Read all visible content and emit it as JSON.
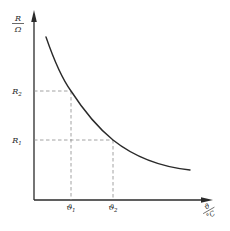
{
  "diagram": {
    "type": "resistance-temperature curve (NTC thermistor)",
    "y_axis": {
      "numerator": "R",
      "denominator": "Ω",
      "ticks": [
        {
          "label": "R",
          "subscript": "2",
          "y_px": 91
        },
        {
          "label": "R",
          "subscript": "1",
          "y_px": 140
        }
      ]
    },
    "x_axis": {
      "numerator": "ϑ",
      "denominator": "°C",
      "ticks": [
        {
          "label": "ϑ",
          "subscript": "1",
          "x_px": 71
        },
        {
          "label": "ϑ",
          "subscript": "2",
          "x_px": 113
        }
      ]
    },
    "curve": {
      "description": "monotonically decreasing convex curve",
      "start": [
        46,
        37
      ],
      "end": [
        190,
        170
      ]
    },
    "colors": {
      "line": "#2a2a2a",
      "dashed": "#8a8a8a",
      "background": "#ffffff"
    }
  }
}
